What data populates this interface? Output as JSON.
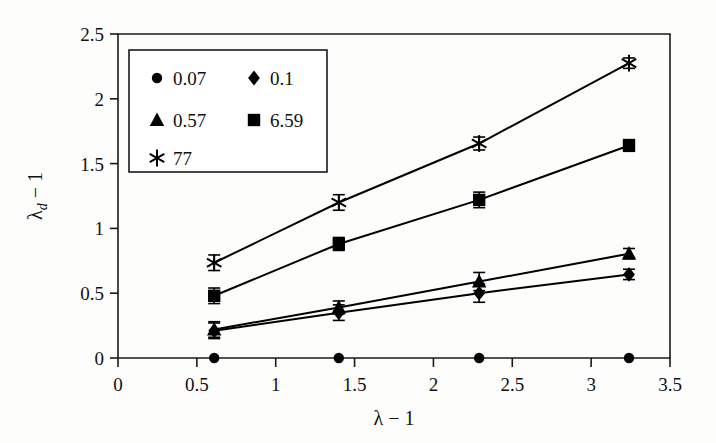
{
  "chart_data": {
    "type": "scatter",
    "title": "",
    "xlabel": "λ − 1",
    "ylabel": "λ_d − 1",
    "ylabel_base": "λ",
    "ylabel_sub": "d",
    "ylabel_tail": "− 1",
    "xlim": [
      0,
      3.5
    ],
    "ylim": [
      0,
      2.5
    ],
    "xticks": [
      0,
      0.5,
      1,
      1.5,
      2,
      2.5,
      3,
      3.5
    ],
    "xtick_labels": [
      "0",
      "0.5",
      "1",
      "1.5",
      "2",
      "2.5",
      "3",
      "3.5"
    ],
    "yticks": [
      0,
      0.5,
      1,
      1.5,
      2,
      2.5
    ],
    "ytick_labels": [
      "0",
      "0.5",
      "1",
      "1.5",
      "2",
      "2.5"
    ],
    "grid": false,
    "legend_position": "upper-left-inside",
    "x": [
      0.61,
      1.4,
      2.29,
      3.24
    ],
    "series": [
      {
        "name": "0.07",
        "marker": "circle",
        "values": [
          0.0,
          0.0,
          0.0,
          0.0
        ],
        "errors": [
          0.0,
          0.0,
          0.0,
          0.0
        ],
        "connected": false
      },
      {
        "name": "0.1",
        "marker": "diamond",
        "values": [
          0.21,
          0.35,
          0.5,
          0.645
        ],
        "errors": [
          0.06,
          0.06,
          0.07,
          0.04
        ],
        "connected": true
      },
      {
        "name": "0.57",
        "marker": "triangle",
        "values": [
          0.22,
          0.39,
          0.59,
          0.805
        ],
        "errors": [
          0.06,
          0.05,
          0.07,
          0.04
        ],
        "connected": true
      },
      {
        "name": "6.59",
        "marker": "square",
        "values": [
          0.48,
          0.88,
          1.22,
          1.64
        ],
        "errors": [
          0.06,
          0.05,
          0.06,
          0.045
        ],
        "connected": true
      },
      {
        "name": "77",
        "marker": "asterisk",
        "values": [
          0.735,
          1.2,
          1.655,
          2.275
        ],
        "errors": [
          0.06,
          0.06,
          0.05,
          0.04
        ],
        "connected": true
      }
    ],
    "legend_entries": [
      {
        "label": "0.07",
        "marker": "circle"
      },
      {
        "label": "0.1",
        "marker": "diamond"
      },
      {
        "label": "0.57",
        "marker": "triangle"
      },
      {
        "label": "6.59",
        "marker": "square"
      },
      {
        "label": "77",
        "marker": "asterisk"
      }
    ],
    "colors": {
      "axis": "#1a1a1a",
      "marker": "#000000",
      "line": "#000000",
      "background": "#fdfdfb"
    }
  }
}
